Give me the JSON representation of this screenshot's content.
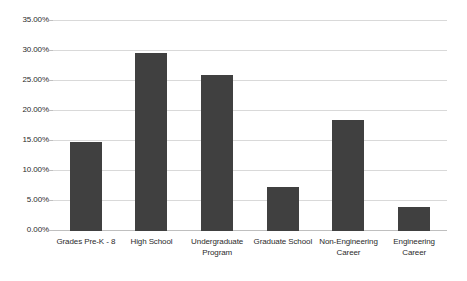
{
  "chart_data": {
    "type": "bar",
    "title": "",
    "subtitle": "",
    "xlabel": "",
    "ylabel": "",
    "ylim": [
      0,
      35
    ],
    "ytick_labels": [
      "35.00%",
      "30.00%",
      "25.00%",
      "20.00%",
      "15.00%",
      "10.00%",
      "5.00%",
      "0.00%"
    ],
    "ytick_values": [
      35,
      30,
      25,
      20,
      15,
      10,
      5,
      0
    ],
    "grid": true,
    "legend": false,
    "legend_position": "none",
    "bar_color": "#404040",
    "gridline_color": "#d9d9d9",
    "background_color": "#ffffff",
    "categories": [
      "Grades Pre-K - 8",
      "High School",
      "Undergraduate Program",
      "Graduate School",
      "Non-Engineering Career",
      "Engineering Career"
    ],
    "values": [
      14.8,
      29.6,
      26.0,
      7.3,
      18.5,
      4.0
    ],
    "value_labels": [
      "14.80%",
      "29.60%",
      "26.00%",
      "7.30%",
      "18.50%",
      "4.00%"
    ]
  }
}
